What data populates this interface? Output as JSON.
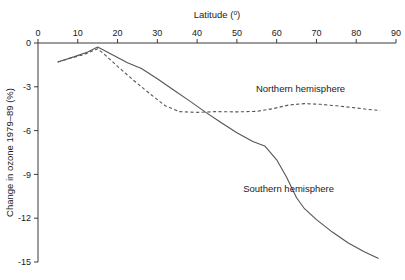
{
  "chart_data": {
    "type": "line",
    "title": "",
    "xlabel": "Latitude (°)",
    "ylabel": "Change in ozone 1979–89 (%)",
    "xlabel_base": "Latitude (",
    "xlabel_sup": "o",
    "xlabel_close": ")",
    "xlim": [
      0,
      90
    ],
    "ylim": [
      -15,
      0
    ],
    "xticks": [
      0,
      10,
      20,
      30,
      40,
      50,
      60,
      70,
      80,
      90
    ],
    "xtick_labels": [
      "0",
      "10",
      "20",
      "30",
      "40",
      "50",
      "60",
      "70",
      "80",
      "90"
    ],
    "yticks": [
      0,
      -3,
      -6,
      -9,
      -12,
      -15
    ],
    "ytick_labels": [
      "0",
      "-3",
      "-6",
      "-9",
      "-12",
      "-15"
    ],
    "grid": false,
    "legend_position": "inline-annotations",
    "x_axis_position": "top",
    "y_axis_position": "left",
    "series": [
      {
        "name": "Northern hemisphere",
        "style": "dashed",
        "color": "#555555",
        "label_x": 66,
        "label_y": -3.35,
        "points": [
          [
            5.0,
            -1.3
          ],
          [
            8.0,
            -1.05
          ],
          [
            11.5,
            -0.8
          ],
          [
            15.0,
            -0.4
          ],
          [
            17.0,
            -0.85
          ],
          [
            20.0,
            -1.6
          ],
          [
            24.0,
            -2.55
          ],
          [
            28.0,
            -3.45
          ],
          [
            32.0,
            -4.3
          ],
          [
            35.5,
            -4.7
          ],
          [
            40.0,
            -4.75
          ],
          [
            45.0,
            -4.7
          ],
          [
            50.0,
            -4.72
          ],
          [
            55.0,
            -4.68
          ],
          [
            59.0,
            -4.5
          ],
          [
            63.0,
            -4.25
          ],
          [
            67.0,
            -4.15
          ],
          [
            71.0,
            -4.2
          ],
          [
            75.0,
            -4.3
          ],
          [
            79.0,
            -4.42
          ],
          [
            83.0,
            -4.55
          ],
          [
            86.0,
            -4.62
          ]
        ]
      },
      {
        "name": "Southern hemisphere",
        "style": "solid",
        "color": "#555555",
        "label_x": 63,
        "label_y": -10.2,
        "points": [
          [
            5.0,
            -1.3
          ],
          [
            9.0,
            -0.95
          ],
          [
            12.5,
            -0.62
          ],
          [
            15.0,
            -0.28
          ],
          [
            18.0,
            -0.7
          ],
          [
            22.5,
            -1.35
          ],
          [
            26.0,
            -1.75
          ],
          [
            30.0,
            -2.45
          ],
          [
            34.0,
            -3.2
          ],
          [
            38.0,
            -3.95
          ],
          [
            42.0,
            -4.72
          ],
          [
            46.0,
            -5.45
          ],
          [
            50.0,
            -6.15
          ],
          [
            54.0,
            -6.75
          ],
          [
            57.0,
            -7.05
          ],
          [
            60.0,
            -8.0
          ],
          [
            62.5,
            -9.2
          ],
          [
            65.0,
            -10.6
          ],
          [
            67.0,
            -11.35
          ],
          [
            70.0,
            -12.1
          ],
          [
            74.0,
            -12.95
          ],
          [
            78.0,
            -13.7
          ],
          [
            82.0,
            -14.3
          ],
          [
            85.5,
            -14.75
          ]
        ]
      }
    ]
  }
}
